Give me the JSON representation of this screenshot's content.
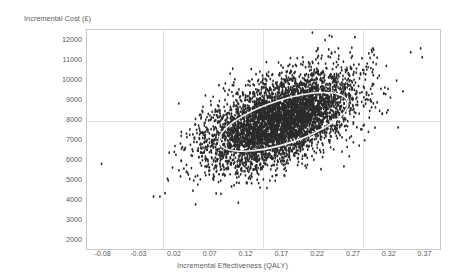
{
  "chart_data": {
    "type": "scatter",
    "title": "",
    "xlabel": "Incremental Effectiveness (QALY)",
    "ylabel": "Incremental Cost (£)",
    "xlim": [
      -0.1025,
      0.3925
    ],
    "ylim": [
      1500,
      12500
    ],
    "xticks": [
      "-0.08",
      "-0.03",
      "0.02",
      "0.07",
      "0.12",
      "0.17",
      "0.22",
      "0.27",
      "0.32",
      "0.37"
    ],
    "xtick_values": [
      -0.08,
      -0.03,
      0.02,
      0.07,
      0.12,
      0.17,
      0.22,
      0.27,
      0.32,
      0.37
    ],
    "yticks": [
      "12000",
      "11000",
      "10000",
      "9000",
      "8000",
      "7000",
      "6000",
      "5000",
      "4000",
      "3000",
      "2000"
    ],
    "ytick_values": [
      12000,
      11000,
      10000,
      9000,
      8000,
      7000,
      6000,
      5000,
      4000,
      3000,
      2000
    ],
    "grid": true,
    "gridlines": {
      "vertical_x": [
        0.005,
        0.145,
        0.285
      ],
      "horizontal_y": [
        7900
      ]
    },
    "legend": "none",
    "n_points": 5000,
    "point_color": "#2b2b2b",
    "point_size": 1.4,
    "series": [
      {
        "name": "Bootstrap replicates",
        "mean_x": 0.168,
        "mean_y": 7950,
        "sd_x": 0.052,
        "sd_y": 1180,
        "correlation": 0.52
      }
    ],
    "annotations": [
      {
        "type": "confidence-ellipse",
        "label": "95% confidence ellipse",
        "color": "#f2f2f2",
        "center_x": 0.173,
        "center_y": 7880,
        "semi_major_qaly": 0.094,
        "semi_minor_cost": 1090,
        "angle_deg": -18
      }
    ]
  },
  "axes": {
    "frame_color": "#c9c9c9",
    "grid_color": "#e2e2e2",
    "tick_label_color": "#5a5a5a"
  }
}
